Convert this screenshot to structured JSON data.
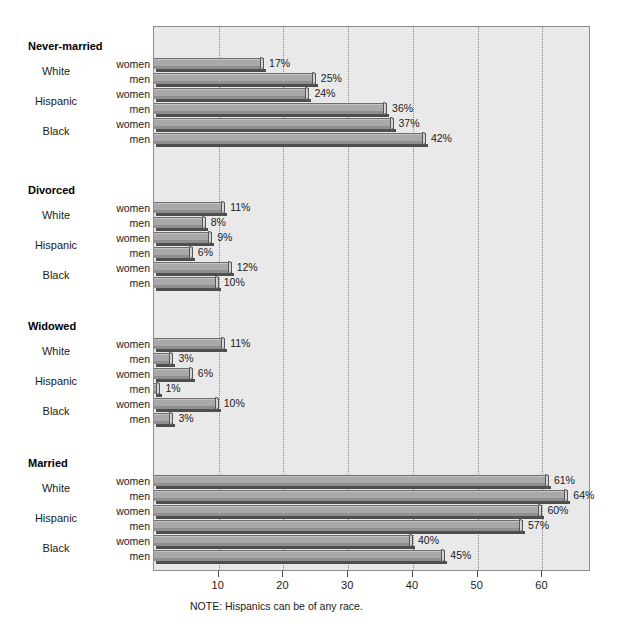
{
  "chart_data": {
    "type": "bar",
    "orientation": "horizontal",
    "title": "",
    "xlabel": "",
    "ylabel": "",
    "xlim": [
      0,
      67.5
    ],
    "xticks": [
      10,
      20,
      30,
      40,
      50,
      60
    ],
    "xtick_labels": [
      "10",
      "20",
      "30",
      "40",
      "50",
      "60"
    ],
    "grid": "vertical-dotted",
    "legend": "none",
    "value_suffix": "%",
    "note": "NOTE: Hispanics can be of any race.",
    "series": [
      {
        "name": "women"
      },
      {
        "name": "men"
      }
    ],
    "groups": [
      {
        "label": "Never-married",
        "races": [
          {
            "label": "White",
            "women": 17,
            "men": 25,
            "women_text": "17%",
            "men_text": "25%"
          },
          {
            "label": "Hispanic",
            "women": 24,
            "men": 36,
            "women_text": "24%",
            "men_text": "36%"
          },
          {
            "label": "Black",
            "women": 37,
            "men": 42,
            "women_text": "37%",
            "men_text": "42%"
          }
        ]
      },
      {
        "label": "Divorced",
        "races": [
          {
            "label": "White",
            "women": 11,
            "men": 8,
            "women_text": "11%",
            "men_text": "8%"
          },
          {
            "label": "Hispanic",
            "women": 9,
            "men": 6,
            "women_text": "9%",
            "men_text": "6%"
          },
          {
            "label": "Black",
            "women": 12,
            "men": 10,
            "women_text": "12%",
            "men_text": "10%"
          }
        ]
      },
      {
        "label": "Widowed",
        "races": [
          {
            "label": "White",
            "women": 11,
            "men": 3,
            "women_text": "11%",
            "men_text": "3%"
          },
          {
            "label": "Hispanic",
            "women": 6,
            "men": 1,
            "women_text": "6%",
            "men_text": "1%"
          },
          {
            "label": "Black",
            "women": 10,
            "men": 3,
            "women_text": "10%",
            "men_text": "3%"
          }
        ]
      },
      {
        "label": "Married",
        "races": [
          {
            "label": "White",
            "women": 61,
            "men": 64,
            "women_text": "61%",
            "men_text": "64%"
          },
          {
            "label": "Hispanic",
            "women": 60,
            "men": 57,
            "women_text": "60%",
            "men_text": "57%"
          },
          {
            "label": "Black",
            "women": 40,
            "men": 45,
            "women_text": "40%",
            "men_text": "45%"
          }
        ]
      }
    ],
    "colors": {
      "plot_background": "#e9e9e9",
      "bar_fill": "#a9a9a9",
      "bar_highlight": "#c4c4c4",
      "bar_shadow": "#4e4e4e",
      "frame": "#8d8d8d",
      "gridline": "#8a8a8a",
      "text": "#1a1a1a",
      "page_background": "#ffffff"
    }
  }
}
